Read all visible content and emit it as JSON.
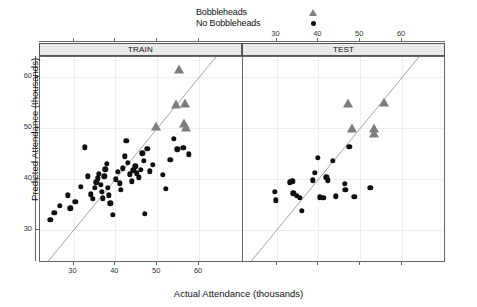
{
  "legend": {
    "items": [
      {
        "label": "Bobbleheads",
        "marker": "triangle-up",
        "color": "#7d7d7d"
      },
      {
        "label": "No Bobbleheads",
        "marker": "circle",
        "color": "#101010"
      }
    ]
  },
  "panels": [
    {
      "strip_label": "TRAIN",
      "id": "train"
    },
    {
      "strip_label": "TEST",
      "id": "test"
    }
  ],
  "axes": {
    "x_title": "Actual Attendance (thousands)",
    "y_title": "Predicted Attendance (thousands)",
    "x_ticks": [
      30,
      40,
      50,
      60
    ],
    "y_ticks": [
      30,
      40,
      50,
      60
    ],
    "x_tick_labels": [
      "30",
      "40",
      "50",
      "60"
    ],
    "y_tick_labels": [
      "30",
      "40",
      "50",
      "60"
    ],
    "xlim": [
      22,
      70
    ],
    "ylim": [
      24,
      64
    ],
    "grid": true
  },
  "chart_data": {
    "type": "scatter",
    "title": "",
    "xlabel": "Actual Attendance (thousands)",
    "ylabel": "Predicted Attendance (thousands)",
    "xlim": [
      22,
      70
    ],
    "ylim": [
      24,
      64
    ],
    "grid": true,
    "legend_position": "top-center",
    "conditioning_variable": "dataset",
    "reference_line": {
      "type": "identity",
      "slope": 1,
      "intercept": 0,
      "color": "#999999"
    },
    "panels": [
      {
        "name": "TRAIN",
        "series": [
          {
            "name": "No Bobbleheads",
            "marker": "circle",
            "color": "#101010",
            "points": [
              [
                24.5,
                32.1
              ],
              [
                25.4,
                33.5
              ],
              [
                26.8,
                34.8
              ],
              [
                28.6,
                36.9
              ],
              [
                29.2,
                34.3
              ],
              [
                30.4,
                35.6
              ],
              [
                31.8,
                38.6
              ],
              [
                32.7,
                46.3
              ],
              [
                33.4,
                40.6
              ],
              [
                34.2,
                37.1
              ],
              [
                34.6,
                36.2
              ],
              [
                35.1,
                38.3
              ],
              [
                35.4,
                39.4
              ],
              [
                35.8,
                40.2
              ],
              [
                36.1,
                41.1
              ],
              [
                36.5,
                39.0
              ],
              [
                36.8,
                37.6
              ],
              [
                37.0,
                36.3
              ],
              [
                37.4,
                40.6
              ],
              [
                37.6,
                42.0
              ],
              [
                37.9,
                43.0
              ],
              [
                38.2,
                38.4
              ],
              [
                38.5,
                36.9
              ],
              [
                38.8,
                35.3
              ],
              [
                39.4,
                33.0
              ],
              [
                40.1,
                40.0
              ],
              [
                40.6,
                41.5
              ],
              [
                41.0,
                39.2
              ],
              [
                41.3,
                38.0
              ],
              [
                41.8,
                42.2
              ],
              [
                42.2,
                44.5
              ],
              [
                42.6,
                47.6
              ],
              [
                43.0,
                43.2
              ],
              [
                43.5,
                41.0
              ],
              [
                43.9,
                39.6
              ],
              [
                44.3,
                41.8
              ],
              [
                44.8,
                42.6
              ],
              [
                45.1,
                41.2
              ],
              [
                45.6,
                40.4
              ],
              [
                46.0,
                41.9
              ],
              [
                46.4,
                45.1
              ],
              [
                46.8,
                43.7
              ],
              [
                47.1,
                33.2
              ],
              [
                47.6,
                46.0
              ],
              [
                48.2,
                41.6
              ],
              [
                49.0,
                42.9
              ],
              [
                51.3,
                40.9
              ],
              [
                52.0,
                38.1
              ],
              [
                53.1,
                43.9
              ],
              [
                54.0,
                48.0
              ],
              [
                54.8,
                45.9
              ],
              [
                56.2,
                46.2
              ],
              [
                57.6,
                44.9
              ]
            ]
          },
          {
            "name": "Bobbleheads",
            "marker": "triangle-up",
            "color": "#7d7d7d",
            "points": [
              [
                49.6,
                50.3
              ],
              [
                54.4,
                54.6
              ],
              [
                55.2,
                61.4
              ],
              [
                56.6,
                54.8
              ],
              [
                56.4,
                50.9
              ],
              [
                56.8,
                50.1
              ]
            ]
          }
        ]
      },
      {
        "name": "TEST",
        "series": [
          {
            "name": "No Bobbleheads",
            "marker": "circle",
            "color": "#101010",
            "points": [
              [
                29.6,
                37.6
              ],
              [
                29.8,
                35.9
              ],
              [
                33.2,
                39.4
              ],
              [
                33.8,
                39.6
              ],
              [
                34.0,
                37.3
              ],
              [
                34.9,
                36.8
              ],
              [
                35.6,
                36.4
              ],
              [
                36.0,
                33.9
              ],
              [
                38.6,
                39.8
              ],
              [
                39.2,
                41.3
              ],
              [
                39.8,
                44.2
              ],
              [
                40.4,
                36.5
              ],
              [
                41.2,
                36.4
              ],
              [
                41.9,
                40.4
              ],
              [
                42.3,
                39.8
              ],
              [
                43.4,
                43.7
              ],
              [
                44.1,
                36.7
              ],
              [
                46.3,
                39.1
              ],
              [
                46.4,
                38.0
              ],
              [
                47.4,
                46.4
              ],
              [
                48.6,
                36.6
              ],
              [
                52.4,
                38.3
              ]
            ]
          },
          {
            "name": "Bobbleheads",
            "marker": "triangle-up",
            "color": "#7d7d7d",
            "points": [
              [
                47.0,
                54.8
              ],
              [
                48.0,
                49.9
              ],
              [
                53.2,
                49.8
              ],
              [
                53.4,
                48.9
              ],
              [
                55.6,
                54.9
              ]
            ]
          }
        ]
      }
    ]
  }
}
